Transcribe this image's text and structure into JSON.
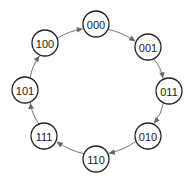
{
  "diagram": {
    "type": "state-cycle",
    "node_radius": 13,
    "colors": {
      "node_stroke": "#222222",
      "edge": "#777777",
      "arrow": "#666666",
      "background": "#ffffff"
    },
    "nodes": [
      {
        "id": "000",
        "label": "000",
        "x": 96,
        "y": 24
      },
      {
        "id": "001",
        "label": "001",
        "x": 148,
        "y": 47
      },
      {
        "id": "011",
        "label": "011",
        "x": 169,
        "y": 91
      },
      {
        "id": "010",
        "label": "010",
        "x": 148,
        "y": 136
      },
      {
        "id": "110",
        "label": "110",
        "x": 96,
        "y": 159
      },
      {
        "id": "111",
        "label": "111",
        "x": 44,
        "y": 136
      },
      {
        "id": "101",
        "label": "101",
        "x": 25,
        "y": 90
      },
      {
        "id": "100",
        "label": "100",
        "x": 45,
        "y": 43
      }
    ],
    "edges": [
      {
        "from": "000",
        "to": "001"
      },
      {
        "from": "001",
        "to": "011"
      },
      {
        "from": "011",
        "to": "010"
      },
      {
        "from": "010",
        "to": "110"
      },
      {
        "from": "110",
        "to": "111"
      },
      {
        "from": "111",
        "to": "101"
      },
      {
        "from": "101",
        "to": "100"
      },
      {
        "from": "100",
        "to": "000"
      }
    ]
  }
}
